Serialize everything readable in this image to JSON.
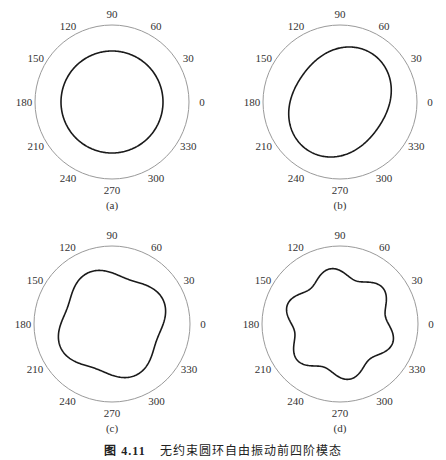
{
  "caption": {
    "label": "图 4.11",
    "text": "无约束圆环自由振动前四阶模态"
  },
  "chart_data": [
    {
      "type": "polar-line",
      "panel": "(a)",
      "angle_ticks": [
        "0",
        "30",
        "60",
        "90",
        "120",
        "150",
        "180",
        "210",
        "240",
        "270",
        "300",
        "330"
      ],
      "center": [
        112,
        102
      ],
      "outer_radius": 77,
      "shape": {
        "base_radius": 51,
        "lobes": 0,
        "amplitude": 0,
        "phase_deg": 0
      },
      "description": "circular mode shape (breathing mode)"
    },
    {
      "type": "polar-line",
      "panel": "(b)",
      "angle_ticks": [
        "0",
        "30",
        "60",
        "90",
        "120",
        "150",
        "180",
        "210",
        "240",
        "270",
        "300",
        "330"
      ],
      "center": [
        340,
        102
      ],
      "outer_radius": 77,
      "shape": {
        "base_radius": 52,
        "lobes": 2,
        "amplitude": 6,
        "phase_deg": 55
      },
      "description": "elliptical mode shape tilted upper-right"
    },
    {
      "type": "polar-line",
      "panel": "(c)",
      "angle_ticks": [
        "0",
        "30",
        "60",
        "90",
        "120",
        "150",
        "180",
        "210",
        "240",
        "270",
        "300",
        "330"
      ],
      "center": [
        112,
        324
      ],
      "outer_radius": 78,
      "shape": {
        "base_radius": 52,
        "lobes": 4,
        "amplitude": 4.5,
        "phase_deg": 25
      },
      "description": "four-lobed mode shape"
    },
    {
      "type": "polar-line",
      "panel": "(d)",
      "angle_ticks": [
        "0",
        "30",
        "60",
        "90",
        "120",
        "150",
        "180",
        "210",
        "240",
        "270",
        "300",
        "330"
      ],
      "center": [
        340,
        324
      ],
      "outer_radius": 78,
      "shape": {
        "base_radius": 51,
        "lobes": 6,
        "amplitude": 5,
        "phase_deg": 100
      },
      "description": "six-lobed mode shape"
    }
  ]
}
